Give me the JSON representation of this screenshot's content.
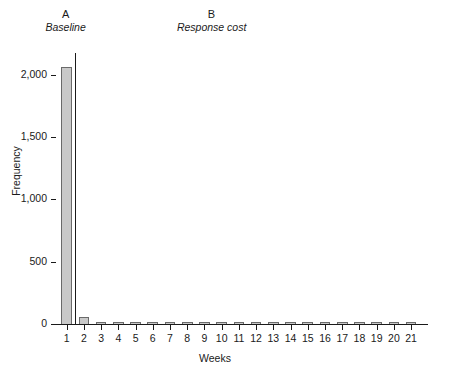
{
  "figure": {
    "panels": [
      {
        "letter": "A",
        "name": "Baseline"
      },
      {
        "letter": "B",
        "name": "Response cost"
      }
    ]
  },
  "chart_data": {
    "type": "bar",
    "title": "",
    "xlabel": "Weeks",
    "ylabel": "Frequency",
    "categories": [
      "1",
      "2",
      "3",
      "4",
      "5",
      "6",
      "7",
      "8",
      "9",
      "10",
      "11",
      "12",
      "13",
      "14",
      "15",
      "16",
      "17",
      "18",
      "19",
      "20",
      "21"
    ],
    "values": [
      2060,
      60,
      8,
      12,
      6,
      14,
      7,
      6,
      9,
      5,
      4,
      7,
      6,
      12,
      9,
      14,
      6,
      13,
      7,
      8,
      9
    ],
    "ylim": [
      0,
      2200
    ],
    "yticks": [
      0,
      500,
      1000,
      1500,
      2000
    ],
    "ytick_labels": [
      "0",
      "500",
      "1,000",
      "1,500",
      "2,000"
    ],
    "grid": false,
    "legend": null,
    "phase_divider_after_category": "1",
    "phases": [
      {
        "label": "A",
        "name": "Baseline",
        "categories": [
          "1"
        ]
      },
      {
        "label": "B",
        "name": "Response cost",
        "categories": [
          "2",
          "3",
          "4",
          "5",
          "6",
          "7",
          "8",
          "9",
          "10",
          "11",
          "12",
          "13",
          "14",
          "15",
          "16",
          "17",
          "18",
          "19",
          "20",
          "21"
        ]
      }
    ],
    "colors": {
      "bar_fill": "#c9c9c9",
      "bar_edge": "#6a6a6a",
      "axis": "#1a1a1a"
    }
  }
}
